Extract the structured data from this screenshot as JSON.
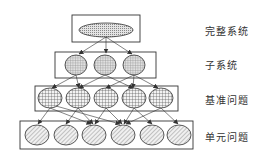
{
  "diagram": {
    "levels": [
      {
        "id": "complete-system",
        "label": "完整系统",
        "node_count": 1,
        "fill": "dots"
      },
      {
        "id": "subsystem",
        "label": "子系统",
        "node_count": 3,
        "fill": "fine-grid"
      },
      {
        "id": "benchmark-problem",
        "label": "基准问题",
        "node_count": 5,
        "fill": "grid"
      },
      {
        "id": "unit-problem",
        "label": "单元问题",
        "node_count": 6,
        "fill": "diagonal-hatch"
      }
    ],
    "colors": {
      "stroke": "#333333",
      "fill": "#dddddd",
      "background": "#ffffff"
    }
  }
}
